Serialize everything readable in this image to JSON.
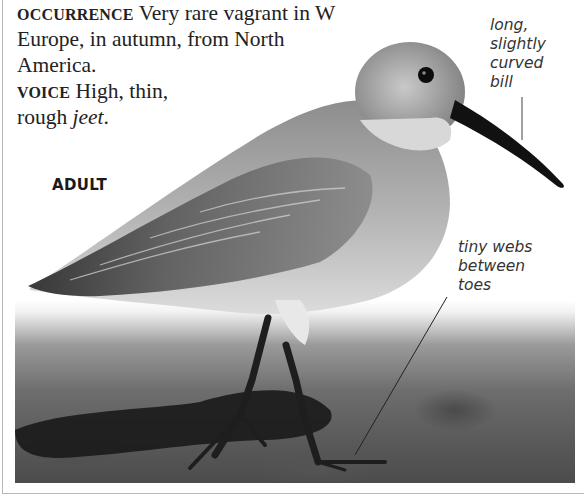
{
  "text": {
    "occurrence_label": "Occurrence",
    "occurrence_text": " Very rare vagrant in W Europe, in autumn, from North America.",
    "voice_label": "Voice",
    "voice_text": " High, thin, rough ",
    "voice_call": "jeet",
    "voice_end": "."
  },
  "image": {
    "age_label": "ADULT",
    "annotations": [
      {
        "label": "long, slightly curved bill",
        "lines": [
          "long,",
          "slightly",
          "curved",
          "bill"
        ]
      },
      {
        "label": "tiny webs between toes",
        "lines": [
          "tiny webs",
          "between",
          "toes"
        ]
      }
    ]
  },
  "colors": {
    "text": "#222222",
    "frame": "#b8b8b8",
    "bill": "#111111",
    "legs": "#1e1e1e"
  }
}
